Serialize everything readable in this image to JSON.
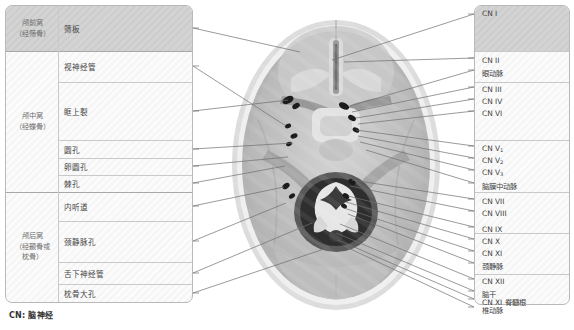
{
  "figure": {
    "footer_note": "CN: 脑神经",
    "accent_shade_color": "#d3d3d3",
    "panel_border_color": "#b9b9b9",
    "leader_line_color": "#6f6f6f",
    "image_caption": "颅底内面观 CT 轴位图（颅底孔裂）"
  },
  "left_table": {
    "groups": [
      {
        "label": "颅前窝\n（经筛骨）",
        "label_line1": "颅前窝",
        "label_line2": "（经筛骨）",
        "top": 6,
        "height": 45,
        "shaded": true
      },
      {
        "label": "颅中窝\n（经蝶骨）",
        "label_line1": "颅中窝",
        "label_line2": "（经蝶骨）",
        "top": 51,
        "height": 141,
        "shaded": false
      },
      {
        "label": "颅后窝\n（经颞骨或枕骨）",
        "label_line1": "颅后窝",
        "label_line2": "（经颞骨或",
        "label_line3": "枕骨）",
        "top": 192,
        "height": 110,
        "shaded": false
      }
    ],
    "rows": [
      {
        "name": "筛板",
        "top": 6,
        "height": 45,
        "shaded": true
      },
      {
        "name": "视神经管",
        "top": 51,
        "height": 31,
        "shaded": false
      },
      {
        "name": "眶上裂",
        "top": 82,
        "height": 58,
        "shaded": false
      },
      {
        "name": "圆孔",
        "top": 140,
        "height": 18,
        "shaded": false
      },
      {
        "name": "卵圆孔",
        "top": 158,
        "height": 17,
        "shaded": false
      },
      {
        "name": "棘孔",
        "top": 175,
        "height": 17,
        "shaded": false
      },
      {
        "name": "内听道",
        "top": 192,
        "height": 29,
        "shaded": false
      },
      {
        "name": "颈静脉孔",
        "top": 221,
        "height": 41,
        "shaded": false
      },
      {
        "name": "舌下神经管",
        "top": 262,
        "height": 22,
        "shaded": false
      },
      {
        "name": "枕骨大孔",
        "top": 284,
        "height": 18,
        "shaded": false
      }
    ]
  },
  "right_labels": {
    "groups": [
      {
        "top": 6,
        "height": 45,
        "shaded": true
      },
      {
        "top": 51,
        "height": 31,
        "shaded": false
      },
      {
        "top": 82,
        "height": 58,
        "shaded": false
      },
      {
        "top": 140,
        "height": 52,
        "shaded": false
      },
      {
        "top": 192,
        "height": 41,
        "shaded": false
      },
      {
        "top": 233,
        "height": 41,
        "shaded": false
      },
      {
        "top": 274,
        "height": 24,
        "shaded": false
      }
    ],
    "items": [
      {
        "text": "CN I",
        "base": "CN I",
        "sub": "",
        "top": 8
      },
      {
        "text": "CN II",
        "base": "CN II",
        "sub": "",
        "top": 55
      },
      {
        "text": "眼动脉",
        "base": "眼动脉",
        "sub": "",
        "top": 67
      },
      {
        "text": "CN III",
        "base": "CN III",
        "sub": "",
        "top": 84
      },
      {
        "text": "CN IV",
        "base": "CN IV",
        "sub": "",
        "top": 96
      },
      {
        "text": "CN VI",
        "base": "CN VI",
        "sub": "",
        "top": 108
      },
      {
        "text": "CN V1",
        "base": "CN V",
        "sub": "1",
        "top": 143
      },
      {
        "text": "CN V2",
        "base": "CN V",
        "sub": "2",
        "top": 155
      },
      {
        "text": "CN V3",
        "base": "CN V",
        "sub": "3",
        "top": 167
      },
      {
        "text": "脑膜中动脉",
        "base": "脑膜中动脉",
        "sub": "",
        "top": 180
      },
      {
        "text": "CN VII",
        "base": "CN VII",
        "sub": "",
        "top": 196
      },
      {
        "text": "CN VIII",
        "base": "CN VIII",
        "sub": "",
        "top": 208
      },
      {
        "text": "CN IX",
        "base": "CN IX",
        "sub": "",
        "top": 224
      },
      {
        "text": "CN X",
        "base": "CN X",
        "sub": "",
        "top": 236
      },
      {
        "text": "CN XI",
        "base": "CN XI",
        "sub": "",
        "top": 248
      },
      {
        "text": "颈静脉",
        "base": "颈静脉",
        "sub": "",
        "top": 260
      },
      {
        "text": "CN XII",
        "base": "CN XII",
        "sub": "",
        "top": 276
      },
      {
        "text": "脑干",
        "base": "脑干",
        "sub": "",
        "top": 288
      },
      {
        "text": "CN XI 脊髓根",
        "base": "CN XI 脊髓根",
        "sub": "",
        "top": 296
      },
      {
        "text": "椎动脉",
        "base": "椎动脉",
        "sub": "",
        "top": 304
      }
    ]
  },
  "leader_lines": {
    "left": [
      {
        "from_x": 193,
        "from_y": 28,
        "to_x": 300,
        "to_y": 52
      },
      {
        "from_x": 193,
        "from_y": 66,
        "to_x": 286,
        "to_y": 126
      },
      {
        "from_x": 193,
        "from_y": 111,
        "to_x": 288,
        "to_y": 100
      },
      {
        "from_x": 193,
        "from_y": 149,
        "to_x": 293,
        "to_y": 143
      },
      {
        "from_x": 193,
        "from_y": 166,
        "to_x": 288,
        "to_y": 157
      },
      {
        "from_x": 193,
        "from_y": 183,
        "to_x": 285,
        "to_y": 166
      },
      {
        "from_x": 193,
        "from_y": 206,
        "to_x": 284,
        "to_y": 187
      },
      {
        "from_x": 193,
        "from_y": 241,
        "to_x": 286,
        "to_y": 203
      },
      {
        "from_x": 193,
        "from_y": 273,
        "to_x": 312,
        "to_y": 223
      },
      {
        "from_x": 193,
        "from_y": 293,
        "to_x": 330,
        "to_y": 247
      }
    ],
    "right": [
      {
        "from_x": 474,
        "from_y": 14,
        "to_x": 332,
        "to_y": 60
      },
      {
        "from_x": 474,
        "from_y": 58,
        "to_x": 344,
        "to_y": 62
      },
      {
        "from_x": 474,
        "from_y": 70,
        "to_x": 350,
        "to_y": 106
      },
      {
        "from_x": 474,
        "from_y": 87,
        "to_x": 352,
        "to_y": 112
      },
      {
        "from_x": 474,
        "from_y": 99,
        "to_x": 356,
        "to_y": 118
      },
      {
        "from_x": 474,
        "from_y": 111,
        "to_x": 358,
        "to_y": 124
      },
      {
        "from_x": 474,
        "from_y": 146,
        "to_x": 356,
        "to_y": 130
      },
      {
        "from_x": 474,
        "from_y": 158,
        "to_x": 358,
        "to_y": 136
      },
      {
        "from_x": 474,
        "from_y": 170,
        "to_x": 360,
        "to_y": 142
      },
      {
        "from_x": 474,
        "from_y": 183,
        "to_x": 366,
        "to_y": 150
      },
      {
        "from_x": 474,
        "from_y": 199,
        "to_x": 352,
        "to_y": 180
      },
      {
        "from_x": 474,
        "from_y": 211,
        "to_x": 350,
        "to_y": 186
      },
      {
        "from_x": 474,
        "from_y": 227,
        "to_x": 348,
        "to_y": 196
      },
      {
        "from_x": 474,
        "from_y": 239,
        "to_x": 346,
        "to_y": 202
      },
      {
        "from_x": 474,
        "from_y": 251,
        "to_x": 344,
        "to_y": 208
      },
      {
        "from_x": 474,
        "from_y": 263,
        "to_x": 348,
        "to_y": 214
      },
      {
        "from_x": 474,
        "from_y": 279,
        "to_x": 340,
        "to_y": 224
      },
      {
        "from_x": 474,
        "from_y": 291,
        "to_x": 336,
        "to_y": 233
      },
      {
        "from_x": 474,
        "from_y": 299,
        "to_x": 338,
        "to_y": 240
      },
      {
        "from_x": 474,
        "from_y": 307,
        "to_x": 344,
        "to_y": 246
      }
    ]
  },
  "foramina_markers": [
    {
      "cx": 288,
      "cy": 100,
      "rx": 6,
      "ry": 3.5,
      "rot": -28
    },
    {
      "cx": 296,
      "cy": 106,
      "rx": 4,
      "ry": 2.6,
      "rot": -28
    },
    {
      "cx": 288,
      "cy": 126,
      "rx": 3.2,
      "ry": 2.2,
      "rot": -20
    },
    {
      "cx": 294,
      "cy": 136,
      "rx": 3.6,
      "ry": 2.4,
      "rot": -20
    },
    {
      "cx": 289,
      "cy": 144,
      "rx": 3.0,
      "ry": 2.0,
      "rot": -20
    },
    {
      "cx": 286,
      "cy": 186,
      "rx": 4.0,
      "ry": 2.6,
      "rot": -35
    },
    {
      "cx": 292,
      "cy": 196,
      "rx": 3.4,
      "ry": 2.2,
      "rot": -35
    },
    {
      "cx": 344,
      "cy": 106,
      "rx": 5.5,
      "ry": 3.2,
      "rot": 28
    },
    {
      "cx": 352,
      "cy": 118,
      "rx": 4.2,
      "ry": 2.6,
      "rot": 28
    },
    {
      "cx": 356,
      "cy": 130,
      "rx": 3.6,
      "ry": 2.4,
      "rot": 28
    },
    {
      "cx": 352,
      "cy": 182,
      "rx": 4.0,
      "ry": 2.6,
      "rot": 35
    },
    {
      "cx": 346,
      "cy": 196,
      "rx": 3.6,
      "ry": 2.4,
      "rot": 35
    },
    {
      "cx": 344,
      "cy": 206,
      "rx": 3.2,
      "ry": 2.2,
      "rot": 35
    }
  ]
}
